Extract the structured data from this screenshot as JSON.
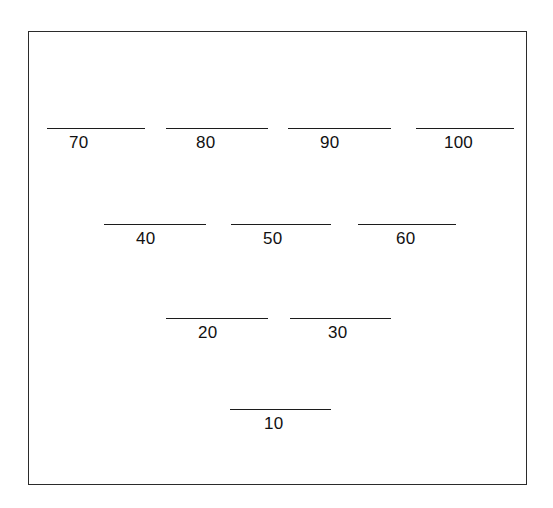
{
  "figure": {
    "background_color": "#ffffff",
    "frame_color": "#2b2b2b",
    "rule_color": "#1c1c1c",
    "label_color": "#111111"
  },
  "chart_data": {
    "type": "diagram",
    "title": "",
    "subtitle": "",
    "xlabel": "",
    "ylabel": "",
    "rows": [
      {
        "row_index": 1,
        "labels": [
          "70",
          "80",
          "90",
          "100"
        ],
        "values": [
          70,
          80,
          90,
          100
        ]
      },
      {
        "row_index": 2,
        "labels": [
          "40",
          "50",
          "60"
        ],
        "values": [
          40,
          50,
          60
        ]
      },
      {
        "row_index": 3,
        "labels": [
          "20",
          "30"
        ],
        "values": [
          20,
          30
        ]
      },
      {
        "row_index": 4,
        "labels": [
          "10"
        ],
        "values": [
          10
        ]
      }
    ],
    "categories": [
      "70",
      "80",
      "90",
      "100",
      "40",
      "50",
      "60",
      "20",
      "30",
      "10"
    ],
    "values": [
      70,
      80,
      90,
      100,
      40,
      50,
      60,
      20,
      30,
      10
    ]
  },
  "blanks": [
    {
      "id": "blank-70",
      "label": "70",
      "row": 1,
      "left": 18,
      "top": 96,
      "width": 98,
      "label_left": 22
    },
    {
      "id": "blank-80",
      "label": "80",
      "row": 1,
      "left": 137,
      "top": 96,
      "width": 102,
      "label_left": 30
    },
    {
      "id": "blank-90",
      "label": "90",
      "row": 1,
      "left": 259,
      "top": 96,
      "width": 103,
      "label_left": 32
    },
    {
      "id": "blank-100",
      "label": "100",
      "row": 1,
      "left": 387,
      "top": 96,
      "width": 98,
      "label_left": 28
    },
    {
      "id": "blank-40",
      "label": "40",
      "row": 2,
      "left": 75,
      "top": 192,
      "width": 102,
      "label_left": 32
    },
    {
      "id": "blank-50",
      "label": "50",
      "row": 2,
      "left": 202,
      "top": 192,
      "width": 100,
      "label_left": 32
    },
    {
      "id": "blank-60",
      "label": "60",
      "row": 2,
      "left": 329,
      "top": 192,
      "width": 98,
      "label_left": 38
    },
    {
      "id": "blank-20",
      "label": "20",
      "row": 3,
      "left": 137,
      "top": 286,
      "width": 102,
      "label_left": 32
    },
    {
      "id": "blank-30",
      "label": "30",
      "row": 3,
      "left": 261,
      "top": 286,
      "width": 101,
      "label_left": 38
    },
    {
      "id": "blank-10",
      "label": "10",
      "row": 4,
      "left": 201,
      "top": 377,
      "width": 101,
      "label_left": 34
    }
  ]
}
